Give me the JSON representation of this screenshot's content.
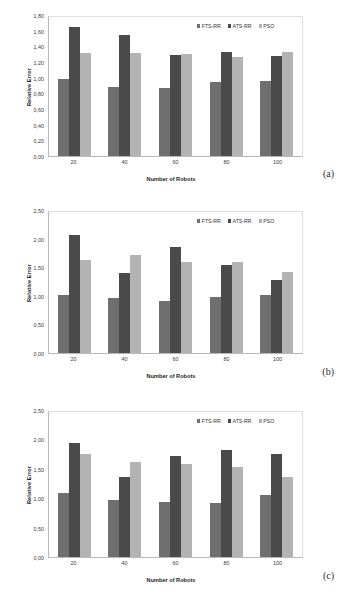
{
  "figure": {
    "series_colors": {
      "FTS-RR": "#6f6f6f",
      "ATS-RR": "#4a4a4a",
      "PSO": "#b3b3b3"
    },
    "legend_labels": [
      "FTS-RR",
      "ATS-RR",
      "PSO"
    ]
  },
  "panels": [
    {
      "tag": "(a)"
    },
    {
      "tag": "(b)"
    },
    {
      "tag": "(c)"
    }
  ],
  "chart_data": [
    {
      "type": "bar",
      "title": "",
      "xlabel": "Number of Robots",
      "ylabel": "Relative Error",
      "categories": [
        "20",
        "40",
        "60",
        "80",
        "100"
      ],
      "ylim": [
        0.0,
        1.8
      ],
      "ytick_labels": [
        "0,00",
        "0,20",
        "0,40",
        "0,60",
        "0,80",
        "1,00",
        "1,20",
        "1,40",
        "1,60",
        "1,80"
      ],
      "ytick_values": [
        0.0,
        0.2,
        0.4,
        0.6,
        0.8,
        1.0,
        1.2,
        1.4,
        1.6,
        1.8
      ],
      "grid": false,
      "legend_position": "top-right",
      "series": [
        {
          "name": "FTS-RR",
          "values": [
            1.0,
            0.9,
            0.88,
            0.96,
            0.97
          ]
        },
        {
          "name": "ATS-RR",
          "values": [
            1.67,
            1.57,
            1.31,
            1.35,
            1.29
          ]
        },
        {
          "name": "PSO",
          "values": [
            1.34,
            1.33,
            1.32,
            1.28,
            1.35
          ]
        }
      ]
    },
    {
      "type": "bar",
      "title": "",
      "xlabel": "Number of Robots",
      "ylabel": "Relative Error",
      "categories": [
        "20",
        "40",
        "60",
        "80",
        "100"
      ],
      "ylim": [
        0.0,
        2.5
      ],
      "ytick_labels": [
        "0,00",
        "0,50",
        "1,00",
        "1,50",
        "2,00",
        "2,50"
      ],
      "ytick_values": [
        0.0,
        0.5,
        1.0,
        1.5,
        2.0,
        2.5
      ],
      "grid": false,
      "legend_position": "top-right",
      "series": [
        {
          "name": "FTS-RR",
          "values": [
            1.02,
            0.98,
            0.92,
            0.99,
            1.02
          ]
        },
        {
          "name": "ATS-RR",
          "values": [
            2.1,
            1.42,
            1.88,
            1.56,
            1.3
          ]
        },
        {
          "name": "PSO",
          "values": [
            1.65,
            1.73,
            1.61,
            1.61,
            1.44
          ]
        }
      ]
    },
    {
      "type": "bar",
      "title": "",
      "xlabel": "Number of Robots",
      "ylabel": "Relative Error",
      "categories": [
        "20",
        "40",
        "60",
        "80",
        "100"
      ],
      "ylim": [
        0.0,
        2.5
      ],
      "ytick_labels": [
        "0,00",
        "0,50",
        "1,00",
        "1,50",
        "2,00",
        "2,50"
      ],
      "ytick_values": [
        0.0,
        0.5,
        1.0,
        1.5,
        2.0,
        2.5
      ],
      "grid": false,
      "legend_position": "top-right",
      "series": [
        {
          "name": "FTS-RR",
          "values": [
            1.11,
            0.99,
            0.95,
            0.93,
            1.07
          ]
        },
        {
          "name": "ATS-RR",
          "values": [
            1.96,
            1.38,
            1.74,
            1.85,
            1.77
          ]
        },
        {
          "name": "PSO",
          "values": [
            1.77,
            1.64,
            1.6,
            1.55,
            1.38
          ]
        }
      ]
    }
  ]
}
